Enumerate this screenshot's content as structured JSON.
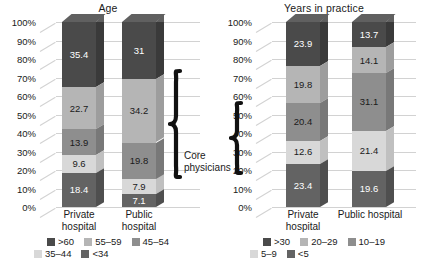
{
  "figure": {
    "annotation_label": "Core\nphysicians"
  },
  "palette": {
    "s1": "#4a4a4a",
    "s2": "#b5b5b5",
    "s3": "#8e8e8e",
    "s4": "#d8d8d8",
    "s5": "#636363",
    "s1_top": "#606060",
    "s1_side": "#3a3a3a",
    "s2_top": "#c9c9c9",
    "s2_side": "#9d9d9d",
    "s3_top": "#a5a5a5",
    "s3_side": "#787878",
    "s4_top": "#e8e8e8",
    "s4_side": "#c0c0c0",
    "s5_top": "#7a7a7a",
    "s5_side": "#4f4f4f",
    "gridline": "#d2d2d2",
    "text": "#1a1a1a",
    "label_on_dark": "#ffffff",
    "label_on_light": "#1a1a1a"
  },
  "yaxis": {
    "ticks": [
      "100%",
      "90%",
      "80%",
      "70%",
      "60%",
      "50%",
      "40%",
      "30%",
      "20%",
      "10%",
      "0%"
    ],
    "min": 0,
    "max": 100,
    "step": 10
  },
  "chart_data": [
    {
      "type": "bar",
      "subtype": "stacked-column-100pct-3d",
      "title": "Age",
      "xlabel": "",
      "ylabel": "",
      "ylim": [
        0,
        100
      ],
      "grid": true,
      "legend_position": "bottom",
      "categories": [
        "Private\nhospital",
        "Public\nhospital"
      ],
      "series": [
        {
          "name": ">60",
          "values": [
            35.4,
            31.0
          ]
        },
        {
          "name": "55–59",
          "values": [
            22.7,
            34.2
          ]
        },
        {
          "name": "45–54",
          "values": [
            13.9,
            19.8
          ]
        },
        {
          "name": "35–44",
          "values": [
            9.6,
            7.9
          ]
        },
        {
          "name": "<34",
          "values": [
            18.4,
            7.1
          ]
        }
      ],
      "value_labels": [
        [
          "35.4",
          "22.7",
          "13.9",
          "9.6",
          "18.4"
        ],
        [
          "31",
          "34.2",
          "19.8",
          "7.9",
          "7.1"
        ]
      ],
      "legend": [
        {
          "label": ">60",
          "color": "#4a4a4a"
        },
        {
          "label": "55–59",
          "color": "#b5b5b5"
        },
        {
          "label": "45–54",
          "color": "#8e8e8e"
        },
        {
          "label": "35–44",
          "color": "#d8d8d8"
        },
        {
          "label": "<34",
          "color": "#636363"
        }
      ]
    },
    {
      "type": "bar",
      "subtype": "stacked-column-100pct-3d",
      "title": "Years in practice",
      "xlabel": "",
      "ylabel": "",
      "ylim": [
        0,
        100
      ],
      "grid": true,
      "legend_position": "bottom",
      "categories": [
        "Private\nhospital",
        "Public hospital"
      ],
      "series": [
        {
          "name": ">30",
          "values": [
            23.9,
            13.7
          ]
        },
        {
          "name": "20–29",
          "values": [
            19.8,
            14.1
          ]
        },
        {
          "name": "10–19",
          "values": [
            20.4,
            31.1
          ]
        },
        {
          "name": "5–9",
          "values": [
            12.6,
            21.4
          ]
        },
        {
          "name": "<5",
          "values": [
            23.4,
            19.6
          ]
        }
      ],
      "value_labels": [
        [
          "23.9",
          "19.8",
          "20.4",
          "12.6",
          "23.4"
        ],
        [
          "13.7",
          "14.1",
          "31.1",
          "21.4",
          "19.6"
        ]
      ],
      "legend": [
        {
          "label": ">30",
          "color": "#4a4a4a"
        },
        {
          "label": "20–29",
          "color": "#b5b5b5"
        },
        {
          "label": "10–19",
          "color": "#8e8e8e"
        },
        {
          "label": "5–9",
          "color": "#d8d8d8"
        },
        {
          "label": "<5",
          "color": "#636363"
        }
      ]
    }
  ]
}
